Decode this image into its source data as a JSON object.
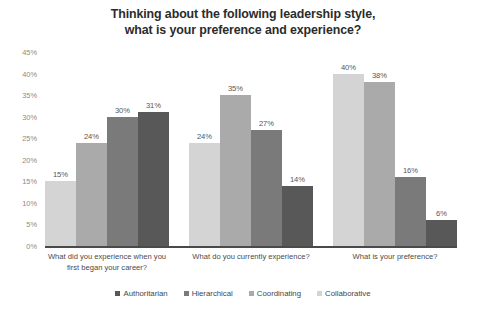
{
  "chart_data": {
    "type": "bar",
    "title": "Thinking about the following leadership style, what is your preference and experience?",
    "title_lines": [
      "Thinking about the following leadership style,",
      "what is your preference and experience?"
    ],
    "xlabel": "",
    "ylabel": "",
    "ylim": [
      0,
      45
    ],
    "grid": false,
    "legend_position": "bottom",
    "value_suffix": "%",
    "categories": [
      "What did you experience when you first began your career?",
      "What do you currently experience?",
      "What is your preference?"
    ],
    "category_lines": [
      [
        "What did you experience when you",
        "first began your career?"
      ],
      [
        "What do you currently experience?"
      ],
      [
        "What is your preference?"
      ]
    ],
    "yticks": [
      "0%",
      "5%",
      "10%",
      "15%",
      "20%",
      "25%",
      "30%",
      "35%",
      "40%",
      "45%"
    ],
    "ytick_values": [
      0,
      5,
      10,
      15,
      20,
      25,
      30,
      35,
      40,
      45
    ],
    "series": [
      {
        "name": "Collaborative",
        "color": "#d4d4d4",
        "values": [
          15,
          24,
          40
        ],
        "labels": [
          "15%",
          "24%",
          "40%"
        ]
      },
      {
        "name": "Coordinating",
        "color": "#aaaaaa",
        "values": [
          24,
          35,
          38
        ],
        "labels": [
          "24%",
          "35%",
          "38%"
        ]
      },
      {
        "name": "Hierarchical",
        "color": "#7a7a7a",
        "values": [
          30,
          27,
          16
        ],
        "labels": [
          "30%",
          "27%",
          "16%"
        ]
      },
      {
        "name": "Authoritarian",
        "color": "#585858",
        "values": [
          31,
          14,
          6
        ],
        "labels": [
          "31%",
          "14%",
          "6%"
        ]
      }
    ],
    "legend": [
      {
        "label": "Authoritarian",
        "color": "#585858"
      },
      {
        "label": "Hierarchical",
        "color": "#7a7a7a"
      },
      {
        "label": "Coordinating",
        "color": "#aaaaaa"
      },
      {
        "label": "Collaborative",
        "color": "#d4d4d4"
      }
    ]
  }
}
